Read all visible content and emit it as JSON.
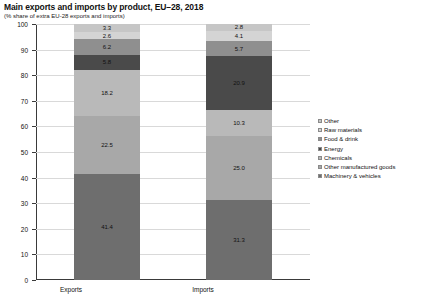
{
  "chart_data": {
    "type": "bar",
    "stacked": true,
    "title": "Main exports and imports by product, EU–28, 2018",
    "subtitle": "(% share of extra EU-28 exports and imports)",
    "xlabel": "",
    "ylabel": "",
    "categories": [
      "Exports",
      "Imports"
    ],
    "ylim": [
      0,
      100
    ],
    "yticks": [
      0,
      10,
      20,
      30,
      40,
      50,
      60,
      70,
      80,
      90,
      100
    ],
    "ytick_labels": [
      "0",
      "10",
      "20",
      "30",
      "40",
      "50",
      "60",
      "70",
      "80",
      "90",
      "100"
    ],
    "grid": true,
    "legend_position": "right",
    "series": [
      {
        "name": "Machinery & vehicles",
        "color": "#6e6e6e",
        "values": [
          41.4,
          31.3
        ],
        "labels": [
          "41.4",
          "31.3"
        ]
      },
      {
        "name": "Other manufactured goods",
        "color": "#a8a8a8",
        "values": [
          22.5,
          25.0
        ],
        "labels": [
          "22.5",
          "25.0"
        ]
      },
      {
        "name": "Chemicals",
        "color": "#b9b9b9",
        "values": [
          18.2,
          10.3
        ],
        "labels": [
          "18.2",
          "10.3"
        ]
      },
      {
        "name": "Energy",
        "color": "#4a4a4a",
        "values": [
          5.8,
          20.9
        ],
        "labels": [
          "5.8",
          "20.9"
        ]
      },
      {
        "name": "Food & drink",
        "color": "#8f8f8f",
        "values": [
          6.2,
          5.7
        ],
        "labels": [
          "6.2",
          "5.7"
        ]
      },
      {
        "name": "Raw materials",
        "color": "#d4d4d4",
        "values": [
          2.6,
          4.1
        ],
        "labels": [
          "2.6",
          "4.1"
        ]
      },
      {
        "name": "Other",
        "color": "#c6c6c6",
        "values": [
          3.3,
          2.8
        ],
        "labels": [
          "3.3",
          "2.8"
        ]
      }
    ],
    "legend_order": [
      "Other",
      "Raw materials",
      "Food & drink",
      "Energy",
      "Chemicals",
      "Other manufactured goods",
      "Machinery & vehicles"
    ]
  }
}
